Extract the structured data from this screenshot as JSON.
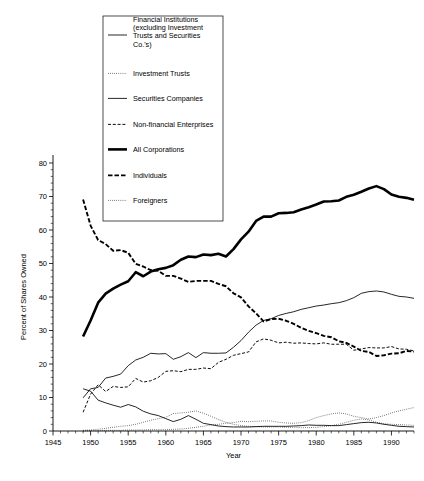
{
  "chart_data": {
    "type": "line",
    "title": "",
    "xlabel": "Year",
    "ylabel": "Percent of Shares Owned",
    "xlim": [
      1945,
      1993
    ],
    "ylim": [
      0,
      80
    ],
    "yticks": [
      0,
      10,
      20,
      30,
      40,
      50,
      60,
      70,
      80
    ],
    "xticks": [
      1945,
      1950,
      1955,
      1960,
      1965,
      1970,
      1975,
      1980,
      1985,
      1990
    ],
    "grid": false,
    "legend_position": "top-left-inset",
    "x": [
      1949,
      1950,
      1951,
      1952,
      1953,
      1954,
      1955,
      1956,
      1957,
      1958,
      1959,
      1960,
      1961,
      1962,
      1963,
      1964,
      1965,
      1966,
      1967,
      1968,
      1969,
      1970,
      1971,
      1972,
      1973,
      1974,
      1975,
      1976,
      1977,
      1978,
      1979,
      1980,
      1981,
      1982,
      1983,
      1984,
      1985,
      1986,
      1987,
      1988,
      1989,
      1990,
      1991,
      1992,
      1993
    ],
    "series": [
      {
        "name": "Financial Institutions (excluding Investment Trusts and Securities Co.'s)",
        "style": "thin-solid",
        "values": [
          9.9,
          12.6,
          13.0,
          15.8,
          16.3,
          17.0,
          19.5,
          21.2,
          22.0,
          23.2,
          23.0,
          23.1,
          21.4,
          22.2,
          23.4,
          21.9,
          23.4,
          23.2,
          23.2,
          23.3,
          25.0,
          27.0,
          29.5,
          31.6,
          33.0,
          33.5,
          34.5,
          35.1,
          35.6,
          36.3,
          36.8,
          37.3,
          37.6,
          38.0,
          38.3,
          38.9,
          39.8,
          41.1,
          41.6,
          41.8,
          41.5,
          40.8,
          40.2,
          40.0,
          39.6
        ]
      },
      {
        "name": "Investment Trusts",
        "style": "fine-dotted",
        "values": [
          0.2,
          0.3,
          0.5,
          0.8,
          1.1,
          1.4,
          1.6,
          2.0,
          2.6,
          3.2,
          3.7,
          4.1,
          5.2,
          5.4,
          5.6,
          6.0,
          5.3,
          4.4,
          3.4,
          2.6,
          2.0,
          1.6,
          1.4,
          1.3,
          1.2,
          1.2,
          1.2,
          1.1,
          1.1,
          1.0,
          1.0,
          1.1,
          1.3,
          1.6,
          2.0,
          2.6,
          3.2,
          3.6,
          3.3,
          2.6,
          2.2,
          2.0,
          1.9,
          1.8,
          1.7
        ]
      },
      {
        "name": "Securities Companies",
        "style": "thin-solid-low",
        "values": [
          12.6,
          11.9,
          9.2,
          8.4,
          7.7,
          7.1,
          7.9,
          7.2,
          5.9,
          5.1,
          4.6,
          3.7,
          2.8,
          3.5,
          4.6,
          3.5,
          2.3,
          1.9,
          1.5,
          1.3,
          1.2,
          1.2,
          1.2,
          1.3,
          1.4,
          1.4,
          1.4,
          1.4,
          1.5,
          1.6,
          1.8,
          1.7,
          1.7,
          1.6,
          1.6,
          1.9,
          2.2,
          2.5,
          2.6,
          2.4,
          2.0,
          1.7,
          1.4,
          1.3,
          1.2
        ]
      },
      {
        "name": "Non-financial Enterprises",
        "style": "short-dash",
        "values": [
          5.6,
          11.0,
          13.8,
          11.8,
          13.3,
          13.0,
          13.2,
          15.7,
          14.6,
          15.0,
          16.0,
          17.8,
          18.0,
          17.7,
          18.4,
          18.4,
          18.8,
          18.6,
          20.5,
          21.4,
          22.6,
          23.1,
          23.6,
          26.6,
          27.5,
          27.1,
          26.3,
          26.5,
          26.2,
          26.3,
          26.1,
          26.0,
          26.3,
          25.9,
          25.9,
          25.9,
          24.1,
          24.5,
          24.9,
          24.8,
          24.8,
          25.2,
          24.5,
          24.4,
          23.9
        ]
      },
      {
        "name": "All Corporations",
        "style": "thick-solid",
        "values": [
          28.2,
          33.0,
          38.3,
          41.0,
          42.5,
          43.7,
          44.7,
          47.4,
          46.2,
          47.6,
          48.3,
          48.7,
          49.5,
          51.1,
          52.1,
          51.9,
          52.7,
          52.5,
          52.9,
          52.1,
          54.3,
          57.2,
          59.5,
          62.7,
          64.0,
          64.0,
          65.0,
          65.1,
          65.3,
          66.1,
          66.8,
          67.6,
          68.5,
          68.6,
          68.8,
          69.9,
          70.5,
          71.4,
          72.4,
          73.1,
          72.2,
          70.6,
          69.9,
          69.6,
          69.0
        ]
      },
      {
        "name": "Individuals",
        "style": "dash-dot",
        "values": [
          69.1,
          61.3,
          57.0,
          55.8,
          53.8,
          54.0,
          53.2,
          49.9,
          49.1,
          48.0,
          47.8,
          46.3,
          46.3,
          45.5,
          44.5,
          44.8,
          44.8,
          44.8,
          43.9,
          43.2,
          41.1,
          39.9,
          37.2,
          35.1,
          32.7,
          33.4,
          33.5,
          32.9,
          32.0,
          30.8,
          29.9,
          29.2,
          28.4,
          28.0,
          26.8,
          26.3,
          25.2,
          23.9,
          23.6,
          22.4,
          22.6,
          23.1,
          23.2,
          23.9,
          23.7
        ]
      },
      {
        "name": "Foreigners",
        "style": "fine-dotted-low",
        "values": [
          0.0,
          0.1,
          0.1,
          0.2,
          0.2,
          0.2,
          0.3,
          0.3,
          0.3,
          0.4,
          0.4,
          0.4,
          0.5,
          0.6,
          0.8,
          1.1,
          1.4,
          1.8,
          2.0,
          2.3,
          2.5,
          2.9,
          2.8,
          2.9,
          3.0,
          3.0,
          2.6,
          2.4,
          2.3,
          2.5,
          3.1,
          4.0,
          4.6,
          5.1,
          5.4,
          5.1,
          4.4,
          4.0,
          3.6,
          4.0,
          4.6,
          5.4,
          6.0,
          6.5,
          7.0
        ]
      }
    ]
  },
  "legend": {
    "entries": [
      {
        "label": "Financial Institutions (excluding Investment Trusts and Securities Co.'s)",
        "style": "thin-solid"
      },
      {
        "label": "Investment Trusts",
        "style": "fine-dotted"
      },
      {
        "label": "Securities Companies",
        "style": "thin-solid"
      },
      {
        "label": "Non-financial Enterprises",
        "style": "short-dash"
      },
      {
        "label": "All Corporations",
        "style": "thick-solid"
      },
      {
        "label": "Individuals",
        "style": "dash-dot"
      },
      {
        "label": "Foreigners",
        "style": "fine-dotted"
      }
    ],
    "entry_lines": [
      [
        "Financial Institutions",
        "(excluding Investment",
        "Trusts and Securities",
        "Co.'s)"
      ],
      [
        "Investment Trusts"
      ],
      [
        "Securities Companies"
      ],
      [
        "Non-financial Enterprises"
      ],
      [
        "All Corporations"
      ],
      [
        "Individuals"
      ],
      [
        "Foreigners"
      ]
    ]
  },
  "axes": {
    "y_title": "Percent of Shares Owned",
    "x_title": "Year",
    "y_tick_labels": [
      "0",
      "10",
      "20",
      "30",
      "40",
      "50",
      "60",
      "70",
      "80"
    ],
    "x_tick_labels": [
      "1945",
      "1950",
      "1955",
      "1960",
      "1965",
      "1970",
      "1975",
      "1980",
      "1985",
      "1990"
    ]
  }
}
